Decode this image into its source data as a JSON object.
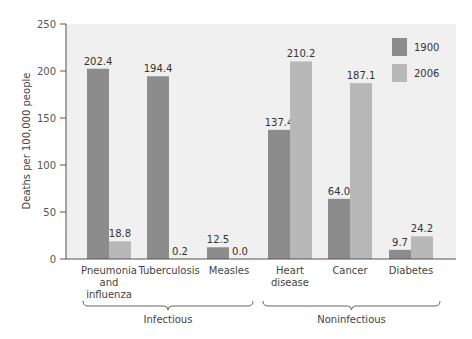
{
  "chart_data": {
    "type": "bar",
    "title": "",
    "xlabel": "",
    "ylabel": "Deaths per 100,000 people",
    "ylim": [
      0,
      250
    ],
    "yticks": [
      0,
      50,
      100,
      150,
      200,
      250
    ],
    "grid": false,
    "legend_position": "top-right",
    "categories": [
      "Pneumonia and influenza",
      "Tuberculosis",
      "Measles",
      "Heart disease",
      "Cancer",
      "Diabetes"
    ],
    "category_lines": [
      [
        "Pneumonia",
        "and",
        "influenza"
      ],
      [
        "Tuberculosis"
      ],
      [
        "Measles"
      ],
      [
        "Heart",
        "disease"
      ],
      [
        "Cancer"
      ],
      [
        "Diabetes"
      ]
    ],
    "series": [
      {
        "name": "1900",
        "color": "#8c8c8c",
        "values": [
          202.4,
          194.4,
          12.5,
          137.4,
          64.0,
          9.7
        ],
        "labels": [
          "202.4",
          "194.4",
          "12.5",
          "137.4",
          "64.0",
          "9.7"
        ]
      },
      {
        "name": "2006",
        "color": "#b8b8b8",
        "values": [
          18.8,
          0.2,
          0.0,
          210.2,
          187.1,
          24.2
        ],
        "labels": [
          "18.8",
          "0.2",
          "0.0",
          "210.2",
          "187.1",
          "24.2"
        ]
      }
    ],
    "groups": [
      {
        "label": "Infectious",
        "categories": [
          "Pneumonia and influenza",
          "Tuberculosis",
          "Measles"
        ]
      },
      {
        "label": "Noninfectious",
        "categories": [
          "Heart disease",
          "Cancer",
          "Diabetes"
        ]
      }
    ],
    "plot_background": "#f0f0f0"
  }
}
